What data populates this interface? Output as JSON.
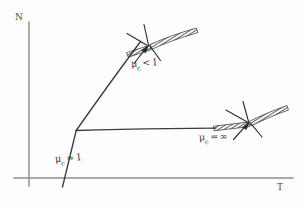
{
  "figure": {
    "type": "hand-drawn-sketch",
    "background_color": "#fdfdfd",
    "ink_color": "#3a3a3a",
    "axis_color": "#9a9a9a"
  },
  "axes": {
    "y_label": "N",
    "x_label": "T",
    "y_axis": {
      "x": 29,
      "y_top": 22,
      "y_bottom": 186
    },
    "x_axis": {
      "y": 178,
      "x_left": 14,
      "x_right": 293
    }
  },
  "curves": [
    {
      "name": "rising-branch",
      "label": "μ",
      "label_sub": "c",
      "label_op": "<",
      "label_value": "1",
      "points": [
        [
          63,
          186
        ],
        [
          76,
          130
        ],
        [
          140,
          42
        ]
      ]
    },
    {
      "name": "plateau-branch",
      "label": "μ",
      "label_sub": "c",
      "label_op": "=",
      "label_value": "∞",
      "points": [
        [
          76,
          130
        ],
        [
          216,
          128
        ]
      ]
    },
    {
      "name": "initial-slope",
      "label": "μ",
      "label_sub": "c",
      "label_op": "≈",
      "label_value": "1",
      "points": [
        [
          63,
          186
        ],
        [
          76,
          130
        ]
      ]
    }
  ],
  "annotations": [
    {
      "name": "upper-kink-marker",
      "description": "hatched corner marker with arrow at upper curve bend",
      "vertex": [
        148,
        46
      ],
      "label_ref": "μ_c < 1"
    },
    {
      "name": "lower-kink-marker",
      "description": "hatched corner marker with arrow at plateau end",
      "vertex": [
        249,
        123
      ],
      "label_ref": "μ_c = ∞"
    }
  ],
  "labels": {
    "axis_n": "N",
    "axis_t": "T",
    "mu_symbol": "μ",
    "mu_subscript": "c",
    "mu_low": {
      "op": "<",
      "value": "1"
    },
    "mu_inf": {
      "op": "=",
      "value": "∞"
    },
    "mu_one": {
      "op": "≈",
      "value": "1"
    }
  }
}
